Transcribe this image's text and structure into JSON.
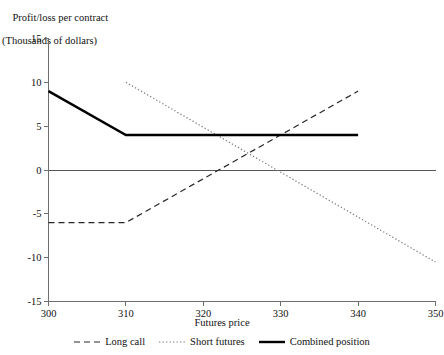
{
  "chart_data": {
    "type": "line",
    "title": "Profit/loss per contract",
    "subtitle": "(Thousands of dollars)",
    "ylabel_line1": "Profit/loss per contract",
    "ylabel_line2": "(Thousands of dollars)",
    "xlabel": "Futures price",
    "xlim": [
      300,
      350
    ],
    "ylim": [
      -15,
      15
    ],
    "xticks": [
      300,
      310,
      320,
      330,
      340,
      350
    ],
    "yticks": [
      -15,
      -10,
      -5,
      0,
      5,
      10,
      15
    ],
    "xtick_labels": [
      "300",
      "310",
      "320",
      "330",
      "340",
      "350"
    ],
    "ytick_labels": [
      "-15",
      "-10",
      "-5",
      "0",
      "5",
      "10",
      "15"
    ],
    "grid": false,
    "zero_line": true,
    "legend_position": "bottom",
    "series": [
      {
        "name": "Long call",
        "style": "dashed",
        "color": "#262626",
        "x": [
          300,
          310,
          340
        ],
        "values": [
          -6,
          -6,
          9
        ]
      },
      {
        "name": "Short futures",
        "style": "dotted",
        "color": "#7a7a7a",
        "x": [
          310,
          350
        ],
        "values": [
          10,
          -10.5
        ]
      },
      {
        "name": "Combined position",
        "style": "solid",
        "color": "#000000",
        "x": [
          300,
          310,
          340
        ],
        "values": [
          9,
          4,
          4
        ]
      }
    ]
  },
  "legend": {
    "items": [
      {
        "label": "Long call",
        "style": "dashed"
      },
      {
        "label": "Short futures",
        "style": "dotted"
      },
      {
        "label": "Combined position",
        "style": "solid"
      }
    ]
  }
}
